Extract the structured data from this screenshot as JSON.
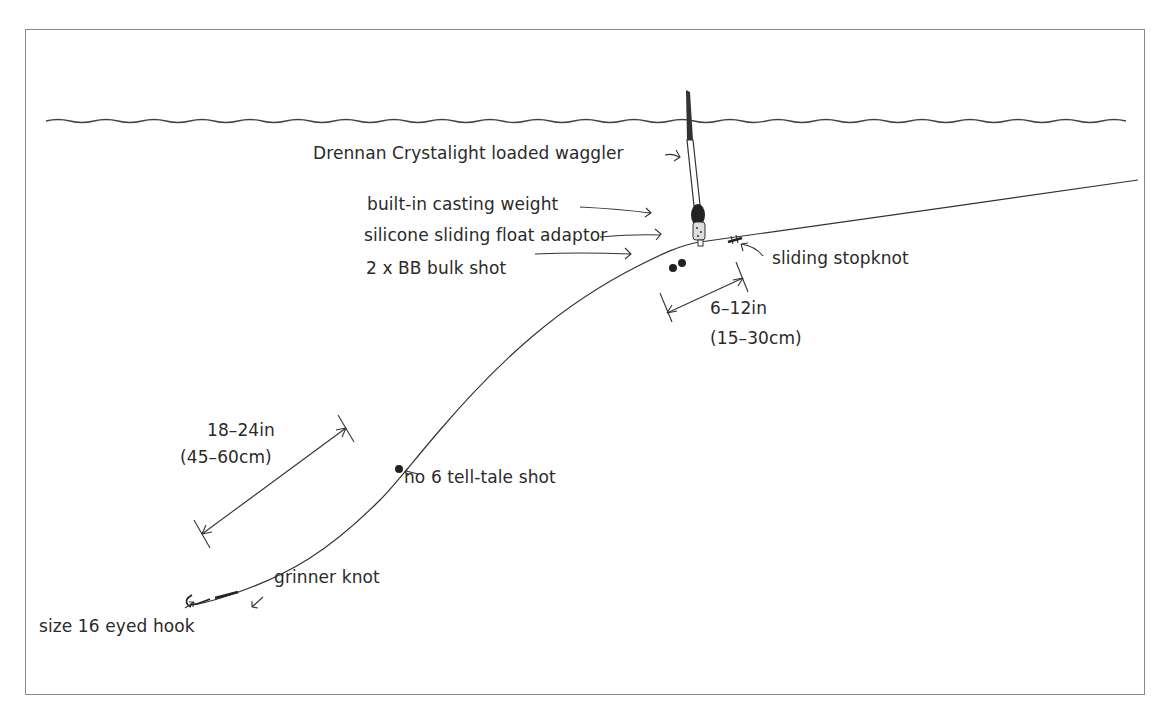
{
  "diagram": {
    "labels": {
      "float": "Drennan Crystalight loaded waggler",
      "casting_weight": "built-in casting weight",
      "float_adaptor": "silicone sliding float adaptor",
      "bulk_shot": "2 x BB bulk shot",
      "stopknot": "sliding stopknot",
      "stopknot_distance_in": "6–12in",
      "stopknot_distance_cm": "(15–30cm)",
      "tell_tale_distance_in": "18–24in",
      "tell_tale_distance_cm": "(45–60cm)",
      "tell_tale_shot": "no 6 tell-tale shot",
      "knot": "grinner knot",
      "hook": "size 16 eyed hook"
    },
    "colors": {
      "ink": "#2a2a2a",
      "frame": "#8a8a8a",
      "background": "#ffffff"
    }
  }
}
